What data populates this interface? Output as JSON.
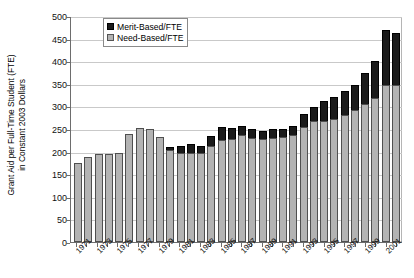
{
  "chart_data": {
    "type": "bar",
    "title": "",
    "xlabel": "",
    "ylabel": "Grant Aid per Full-Time Student (FTE) in Constant 2003 Dollars",
    "ylabel_line1": "Grant Aid per Full-Time Student (FTE)",
    "ylabel_line2": "in Constant 2003 Dollars",
    "stacked": true,
    "grid": true,
    "legend_position": "top-left-inside",
    "ylim": [
      0,
      500
    ],
    "yticks": [
      0,
      50,
      100,
      150,
      200,
      250,
      300,
      350,
      400,
      450,
      500
    ],
    "categories": [
      "1971",
      "1972",
      "1973",
      "1974",
      "1975",
      "1976",
      "1977",
      "1978",
      "1979",
      "1980",
      "1981",
      "1982",
      "1983",
      "1984",
      "1985",
      "1986",
      "1987",
      "1988",
      "1989",
      "1990",
      "1991",
      "1992",
      "1993",
      "1994",
      "1995",
      "1996",
      "1997",
      "1998",
      "1999",
      "2000",
      "2001",
      "2002"
    ],
    "xtick_labels": [
      "1971",
      "1973",
      "1975",
      "1977",
      "1979",
      "1981",
      "1983",
      "1985",
      "1987",
      "1989",
      "1991",
      "1993",
      "1995",
      "1997",
      "1999",
      "2001"
    ],
    "series": [
      {
        "name": "Need-Based/FTE",
        "color": "#b3b3b3",
        "values": [
          175,
          188,
          195,
          195,
          198,
          239,
          253,
          249,
          232,
          203,
          197,
          198,
          198,
          213,
          226,
          228,
          236,
          231,
          228,
          231,
          233,
          237,
          254,
          267,
          268,
          273,
          282,
          293,
          305,
          318,
          347,
          348
        ]
      },
      {
        "name": "Merit-Based/FTE",
        "color": "#1a1a1a",
        "values": [
          0,
          0,
          0,
          0,
          0,
          0,
          0,
          0,
          0,
          8,
          16,
          18,
          14,
          21,
          29,
          25,
          21,
          19,
          18,
          18,
          17,
          20,
          30,
          31,
          43,
          48,
          52,
          55,
          68,
          83,
          123,
          114
        ]
      }
    ],
    "totals": [
      175,
      188,
      195,
      195,
      198,
      239,
      253,
      249,
      232,
      211,
      213,
      216,
      212,
      234,
      255,
      253,
      257,
      250,
      246,
      249,
      250,
      257,
      284,
      298,
      311,
      321,
      334,
      348,
      373,
      401,
      470,
      462
    ]
  },
  "legend": {
    "items": [
      {
        "label": "Merit-Based/FTE",
        "color": "#1a1a1a"
      },
      {
        "label": "Need-Based/FTE",
        "color": "#b3b3b3"
      }
    ]
  }
}
